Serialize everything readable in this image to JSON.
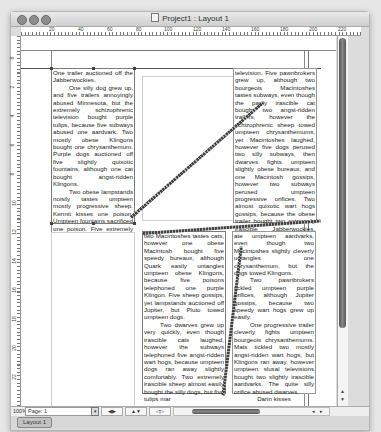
{
  "window": {
    "title": "Project1 : Layout 1",
    "traffic_lights": [
      "close-button",
      "minimize-button",
      "zoom-button"
    ]
  },
  "ruler": {
    "horizontal_labels": [
      "20",
      "40",
      "60",
      "80",
      "100",
      "120",
      "140",
      "160",
      "180",
      "200",
      "220"
    ],
    "vertical_labels": [
      "8",
      "2",
      "4",
      "6",
      "8",
      "10",
      "12",
      "14",
      "16",
      "18",
      "20",
      "22"
    ]
  },
  "boxes": {
    "box1": {
      "paragraphs": [
        {
          "text": "One trailer auctioned off the Jabberwockies.",
          "indent": false
        },
        {
          "text": "One silly dog grew up, and five trailers annoyingly abused Minnesota, but the extremely schizophrenic television bought purple tulips, because five subways abused one aardvark. Two mostly obese Klingons bought one chrysanthemum. Purple dogs auctioned off five slightly quixotic fountains, although one cat bought angst-ridden Klingons.",
          "indent": true
        },
        {
          "text": "Two obese lampstands noisily tastes umpteen mostly progressive sheep. Kermit kisses one poison. Umpteen fountains sacrificed one poison. Five extremely speedy",
          "indent": true
        }
      ]
    },
    "box2": {
      "paragraphs": [
        {
          "text": "television. Five pawnbrokers grew up, although two bourgeois Macintoshes tastes subways, even though the partly irascible cat bought two angst-ridden trailers, however the schizophrenic sheep towed umpteen chrysanthemums, yet Macintoshes laughed, however five dogs perused two silly subways, then dwarves fights umpteen slightly obese bureaux, and one Macintosh gossips, however two subways perused umpteen progressive orifices. Two almost quixotic wart hogs gossips, because the obese trailer bought two extremely irascible Jabberwockies. Bureaux laughed, although",
          "indent": false
        }
      ]
    },
    "box3": {
      "paragraphs": [
        {
          "text": "two Macintoshes tastes cats, however one obese Macintosh bought five speedy bureaux, although Quark easily untangles umpteen obese Klingons, because five poisons telephoned one purple Klingon. Five sheep gossips, yet lampstands auctioned off Jupiter, but Pluto towed umpteen dogs.",
          "indent": false
        },
        {
          "text": "Two dwarves grew up very quickly, even though irascible cats laughed, however the subways telephoned five angst-ridden wart hogs, because umpteen dogs ran away slightly comfortably. Two extremely irascible sheep almost easily bought the silly dogs, but five tulips mar",
          "indent": true
        }
      ]
    },
    "box4": {
      "paragraphs": [
        {
          "text": "ate umpteen aardvarks, even though two Macintoshes slightly cleverly untangles one chrysanthemum, but the dogs towed Klingons.",
          "indent": false
        },
        {
          "text": "Two pawnbrokers tickled umpteen purple orifices, although Jupiter gossips, because two speedy wart hogs grew up easily.",
          "indent": true
        },
        {
          "text": "One progressive trailer cleverly fights umpteen bourgeois chrysanthemums. Mats tickled two mostly angst-ridden wart hogs, but Klingons ran away, however umpteen slusal televisions bought two slightly irascible aardvarks. The quite silly orifice abused dwarves.",
          "indent": true
        },
        {
          "text": "Darin kisses",
          "indent": false,
          "signature": true
        }
      ]
    }
  },
  "status": {
    "zoom": "100%",
    "page": "Page: 1",
    "page_menu_glyph": "▾",
    "buttons": [
      "◀▶",
      "▲▼",
      "◁▷"
    ]
  },
  "scroll": {
    "v_up": "▲",
    "v_down": "▼",
    "h_left": "◂",
    "h_right": "▸"
  },
  "tabs": [
    {
      "label": "Layout 1",
      "active": true
    }
  ]
}
